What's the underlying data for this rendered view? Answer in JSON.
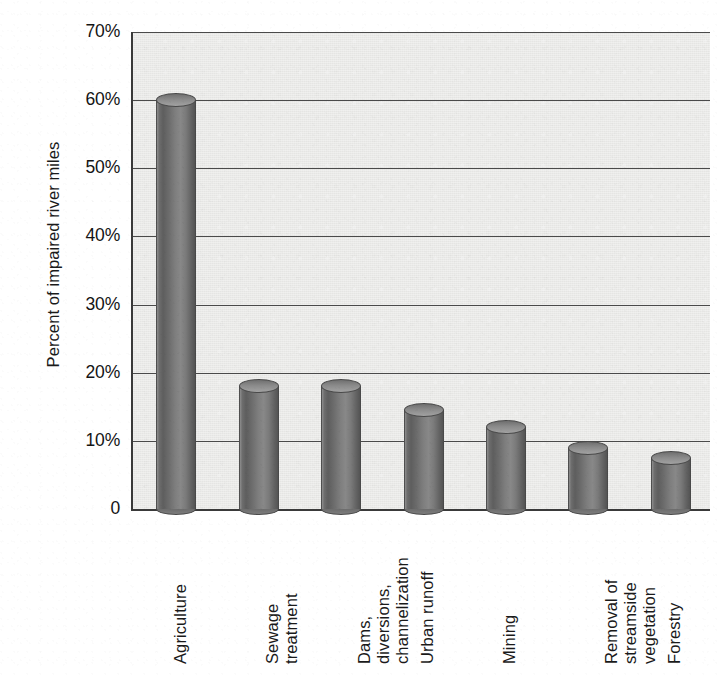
{
  "chart_data": {
    "type": "bar",
    "title": "",
    "xlabel": "",
    "ylabel": "Percent of impaired river miles",
    "ylim": [
      0,
      70
    ],
    "grid": true,
    "legend": "none",
    "categories": [
      "Agriculture",
      "Sewage treatment",
      "Dams, diversions, channelization",
      "Urban runoff",
      "Mining",
      "Removal of streamside vegetation",
      "Forestry"
    ],
    "category_lines": [
      [
        "Agriculture"
      ],
      [
        "Sewage",
        "treatment"
      ],
      [
        "Dams,",
        "diversions,",
        "channelization"
      ],
      [
        "Urban runoff"
      ],
      [
        "Mining"
      ],
      [
        "Removal of",
        "streamside",
        "vegetation"
      ],
      [
        "Forestry"
      ]
    ],
    "values": [
      60,
      18,
      18,
      14.5,
      12,
      9,
      7.5
    ],
    "ytick_labels": [
      "70%",
      "60%",
      "50%",
      "40%",
      "30%",
      "20%",
      "10%",
      "0"
    ],
    "ytick_values": [
      70,
      60,
      50,
      40,
      30,
      20,
      10,
      0
    ],
    "series_color": "#6f6f6f",
    "plot_background": "#e9e9e7",
    "axis_color": "#3a3a3a",
    "gridline_color": "#4a4a4a"
  },
  "caption_remnant": ""
}
